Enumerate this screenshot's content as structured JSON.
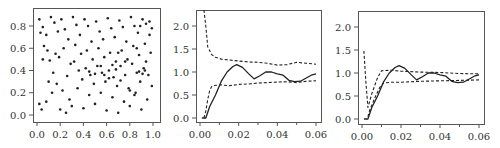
{
  "chart_data": [
    {
      "type": "scatter",
      "title": "",
      "xlabel": "",
      "ylabel": "",
      "xlim": [
        -0.03,
        1.03
      ],
      "ylim": [
        -0.06,
        0.92
      ],
      "xticks": [
        "0.0",
        "0.2",
        "0.4",
        "0.6",
        "0.8",
        "1.0"
      ],
      "yticks": [
        "0.0",
        "0.2",
        "0.4",
        "0.6",
        "0.8"
      ],
      "grid": false,
      "marker_color": "#222222",
      "points": [
        [
          0.02,
          0.86
        ],
        [
          0.05,
          0.79
        ],
        [
          0.03,
          0.74
        ],
        [
          0.08,
          0.72
        ],
        [
          0.06,
          0.62
        ],
        [
          0.09,
          0.58
        ],
        [
          0.05,
          0.5
        ],
        [
          0.12,
          0.88
        ],
        [
          0.15,
          0.83
        ],
        [
          0.18,
          0.75
        ],
        [
          0.11,
          0.49
        ],
        [
          0.16,
          0.55
        ],
        [
          0.19,
          0.52
        ],
        [
          0.14,
          0.38
        ],
        [
          0.1,
          0.3
        ],
        [
          0.17,
          0.28
        ],
        [
          0.13,
          0.2
        ],
        [
          0.08,
          0.12
        ],
        [
          0.04,
          0.05
        ],
        [
          0.02,
          0.1
        ],
        [
          0.21,
          0.86
        ],
        [
          0.24,
          0.77
        ],
        [
          0.27,
          0.68
        ],
        [
          0.23,
          0.6
        ],
        [
          0.29,
          0.46
        ],
        [
          0.26,
          0.35
        ],
        [
          0.22,
          0.22
        ],
        [
          0.28,
          0.14
        ],
        [
          0.2,
          0.05
        ],
        [
          0.25,
          0.02
        ],
        [
          0.31,
          0.88
        ],
        [
          0.34,
          0.81
        ],
        [
          0.37,
          0.72
        ],
        [
          0.33,
          0.63
        ],
        [
          0.38,
          0.55
        ],
        [
          0.32,
          0.48
        ],
        [
          0.36,
          0.4
        ],
        [
          0.39,
          0.32
        ],
        [
          0.35,
          0.24
        ],
        [
          0.3,
          0.08
        ],
        [
          0.41,
          0.86
        ],
        [
          0.44,
          0.8
        ],
        [
          0.47,
          0.66
        ],
        [
          0.43,
          0.58
        ],
        [
          0.48,
          0.5
        ],
        [
          0.42,
          0.42
        ],
        [
          0.46,
          0.36
        ],
        [
          0.49,
          0.28
        ],
        [
          0.45,
          0.18
        ],
        [
          0.4,
          0.06
        ],
        [
          0.51,
          0.84
        ],
        [
          0.54,
          0.75
        ],
        [
          0.57,
          0.68
        ],
        [
          0.53,
          0.6
        ],
        [
          0.58,
          0.52
        ],
        [
          0.52,
          0.44
        ],
        [
          0.56,
          0.38
        ],
        [
          0.59,
          0.3
        ],
        [
          0.55,
          0.2
        ],
        [
          0.5,
          0.1
        ],
        [
          0.61,
          0.87
        ],
        [
          0.64,
          0.78
        ],
        [
          0.67,
          0.7
        ],
        [
          0.63,
          0.56
        ],
        [
          0.68,
          0.48
        ],
        [
          0.62,
          0.4
        ],
        [
          0.66,
          0.34
        ],
        [
          0.69,
          0.26
        ],
        [
          0.65,
          0.16
        ],
        [
          0.6,
          0.04
        ],
        [
          0.71,
          0.85
        ],
        [
          0.74,
          0.79
        ],
        [
          0.77,
          0.66
        ],
        [
          0.73,
          0.58
        ],
        [
          0.78,
          0.5
        ],
        [
          0.72,
          0.44
        ],
        [
          0.76,
          0.36
        ],
        [
          0.79,
          0.24
        ],
        [
          0.75,
          0.12
        ],
        [
          0.7,
          0.02
        ],
        [
          0.81,
          0.88
        ],
        [
          0.84,
          0.8
        ],
        [
          0.87,
          0.74
        ],
        [
          0.83,
          0.62
        ],
        [
          0.88,
          0.54
        ],
        [
          0.82,
          0.46
        ],
        [
          0.86,
          0.38
        ],
        [
          0.89,
          0.3
        ],
        [
          0.85,
          0.2
        ],
        [
          0.8,
          0.08
        ],
        [
          0.91,
          0.86
        ],
        [
          0.94,
          0.82
        ],
        [
          0.97,
          0.72
        ],
        [
          0.93,
          0.64
        ],
        [
          0.98,
          0.56
        ],
        [
          0.92,
          0.42
        ],
        [
          0.96,
          0.36
        ],
        [
          0.99,
          0.26
        ],
        [
          0.95,
          0.14
        ],
        [
          0.9,
          0.05
        ],
        [
          0.45,
          0.39
        ],
        [
          0.58,
          0.36
        ],
        [
          0.62,
          0.33
        ],
        [
          0.68,
          0.41
        ],
        [
          0.72,
          0.31
        ],
        [
          0.88,
          0.39
        ],
        [
          0.91,
          0.37
        ],
        [
          0.93,
          0.4
        ],
        [
          0.8,
          0.22
        ],
        [
          0.84,
          0.18
        ],
        [
          0.55,
          0.44
        ],
        [
          0.5,
          0.37
        ],
        [
          0.65,
          0.45
        ],
        [
          0.76,
          0.48
        ],
        [
          0.7,
          0.56
        ],
        [
          0.86,
          0.6
        ],
        [
          0.94,
          0.48
        ],
        [
          0.99,
          0.78
        ],
        [
          0.97,
          0.84
        ],
        [
          0.89,
          0.8
        ]
      ]
    },
    {
      "type": "line",
      "title": "",
      "xlabel": "",
      "ylabel": "",
      "xlim": [
        -0.002,
        0.062
      ],
      "ylim": [
        -0.1,
        2.35
      ],
      "xticks": [
        "0.00",
        "0.02",
        "0.04",
        "0.06"
      ],
      "yticks": [
        "0.0",
        "0.5",
        "1.0",
        "1.5",
        "2.0"
      ],
      "grid": false,
      "series": [
        {
          "name": "estimate",
          "style": "solid",
          "x": [
            0.001,
            0.003,
            0.005,
            0.008,
            0.011,
            0.014,
            0.017,
            0.019,
            0.022,
            0.025,
            0.028,
            0.031,
            0.034,
            0.037,
            0.04,
            0.043,
            0.046,
            0.049,
            0.052,
            0.055,
            0.058,
            0.06
          ],
          "y": [
            0.0,
            0.0,
            0.25,
            0.5,
            0.8,
            1.0,
            1.12,
            1.16,
            1.1,
            0.97,
            0.85,
            0.92,
            1.0,
            1.0,
            0.96,
            0.93,
            0.82,
            0.79,
            0.8,
            0.87,
            0.94,
            0.96
          ]
        },
        {
          "name": "upper envelope",
          "style": "dashed",
          "x": [
            0.002,
            0.003,
            0.004,
            0.006,
            0.008,
            0.011,
            0.015,
            0.02,
            0.025,
            0.03,
            0.035,
            0.04,
            0.045,
            0.05,
            0.055,
            0.06
          ],
          "y": [
            2.35,
            2.0,
            1.55,
            1.38,
            1.32,
            1.28,
            1.26,
            1.24,
            1.22,
            1.21,
            1.19,
            1.15,
            1.16,
            1.21,
            1.19,
            1.17
          ]
        },
        {
          "name": "lower envelope",
          "style": "dashed",
          "x": [
            0.002,
            0.003,
            0.004,
            0.005,
            0.006,
            0.008,
            0.011,
            0.015,
            0.02,
            0.025,
            0.03,
            0.035,
            0.04,
            0.045,
            0.05,
            0.055,
            0.06
          ],
          "y": [
            0.0,
            0.15,
            0.4,
            0.6,
            0.68,
            0.71,
            0.72,
            0.7,
            0.73,
            0.74,
            0.76,
            0.77,
            0.78,
            0.79,
            0.77,
            0.8,
            0.81
          ]
        }
      ]
    },
    {
      "type": "line",
      "title": "",
      "xlabel": "",
      "ylabel": "",
      "xlim": [
        -0.002,
        0.062
      ],
      "ylim": [
        -0.1,
        2.35
      ],
      "xticks": [
        "0.00",
        "0.02",
        "0.04",
        "0.06"
      ],
      "yticks": [
        "0.0",
        "0.5",
        "1.0",
        "1.5",
        "2.0"
      ],
      "grid": false,
      "series": [
        {
          "name": "estimate",
          "style": "solid",
          "x": [
            0.001,
            0.003,
            0.005,
            0.008,
            0.011,
            0.014,
            0.017,
            0.019,
            0.022,
            0.025,
            0.028,
            0.031,
            0.034,
            0.037,
            0.04,
            0.043,
            0.046,
            0.049,
            0.052,
            0.055,
            0.058,
            0.06
          ],
          "y": [
            0.0,
            0.0,
            0.25,
            0.5,
            0.8,
            1.0,
            1.12,
            1.16,
            1.1,
            0.97,
            0.85,
            0.92,
            1.0,
            1.0,
            0.96,
            0.93,
            0.82,
            0.79,
            0.8,
            0.87,
            0.94,
            0.96
          ]
        },
        {
          "name": "upper envelope",
          "style": "dashed",
          "x": [
            0.001,
            0.002,
            0.003,
            0.005,
            0.008,
            0.01,
            0.015,
            0.02,
            0.03,
            0.04,
            0.05,
            0.06
          ],
          "y": [
            1.48,
            0.8,
            0.25,
            0.55,
            0.9,
            1.05,
            1.06,
            1.04,
            1.02,
            1.01,
            0.99,
            0.98
          ]
        },
        {
          "name": "lower envelope",
          "style": "dashed",
          "x": [
            0.003,
            0.004,
            0.005,
            0.007,
            0.009,
            0.011,
            0.015,
            0.02,
            0.03,
            0.04,
            0.05,
            0.06
          ],
          "y": [
            0.05,
            0.2,
            0.3,
            0.5,
            0.68,
            0.78,
            0.8,
            0.8,
            0.82,
            0.83,
            0.84,
            0.85
          ]
        }
      ]
    }
  ]
}
